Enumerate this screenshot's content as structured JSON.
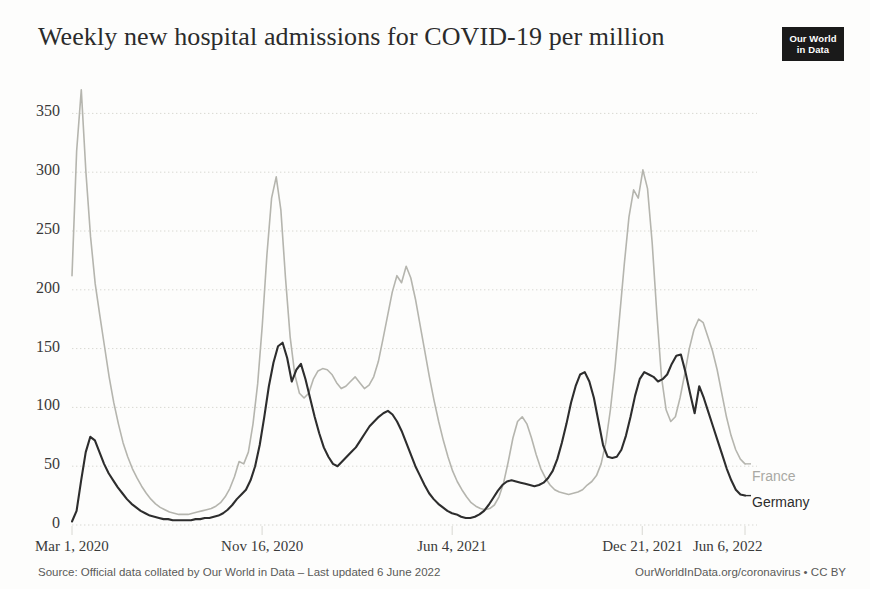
{
  "header": {
    "title": "Weekly new hospital admissions for COVID-19 per million",
    "logo_line1": "Our World",
    "logo_line2": "in Data"
  },
  "footer": {
    "source": "Source: Official data collated by Our World in Data – Last updated 6 June 2022",
    "credit": "OurWorldInData.org/coronavirus • CC BY"
  },
  "legend": {
    "france_label": "France",
    "germany_label": "Germany"
  },
  "colors": {
    "france": "#b5b5ae",
    "germany": "#2d2d2d",
    "grid": "#d8d8d2",
    "text": "#3a3a3a",
    "background": "#fdfdfc",
    "logo_background": "#1a1a1a"
  },
  "chart_data": {
    "type": "line",
    "title": "Weekly new hospital admissions for COVID-19 per million",
    "xlabel": "",
    "ylabel": "",
    "ylim": [
      0,
      375
    ],
    "yticks": [
      0,
      50,
      100,
      150,
      200,
      250,
      300,
      350
    ],
    "ytick_labels": [
      "0",
      "50",
      "100",
      "150",
      "200",
      "250",
      "300",
      "350"
    ],
    "xticks": [
      0,
      37,
      74,
      111,
      131
    ],
    "xtick_labels": [
      "Mar 1, 2020",
      "Nov 16, 2020",
      "Jun 4, 2021",
      "Dec 21, 2021",
      "Jun 6, 2022"
    ],
    "xlim": [
      0,
      131
    ],
    "grid": true,
    "grid_style": "dotted-horizontal",
    "legend_position": "right-inline",
    "x_unit": "week index from Mar 1, 2020",
    "series": [
      {
        "name": "France",
        "color": "#b5b5ae",
        "values": [
          212,
          318,
          370,
          300,
          245,
          205,
          178,
          152,
          126,
          104,
          86,
          70,
          58,
          48,
          40,
          33,
          27,
          22,
          18,
          15,
          13,
          11,
          10,
          9,
          9,
          9,
          10,
          11,
          12,
          13,
          14,
          16,
          19,
          24,
          31,
          41,
          54,
          52,
          62,
          86,
          120,
          170,
          230,
          278,
          296,
          268,
          210,
          160,
          128,
          112,
          108,
          112,
          124,
          131,
          133,
          132,
          128,
          121,
          116,
          118,
          122,
          126,
          121,
          116,
          119,
          126,
          139,
          158,
          178,
          198,
          212,
          206,
          220,
          210,
          192,
          170,
          148,
          126,
          106,
          88,
          72,
          58,
          46,
          37,
          30,
          24,
          19,
          16,
          14,
          13,
          14,
          17,
          24,
          36,
          54,
          74,
          88,
          92,
          86,
          74,
          60,
          48,
          40,
          34,
          30,
          28,
          27,
          26,
          27,
          28,
          30,
          34,
          37,
          42,
          52,
          70,
          98,
          134,
          178,
          222,
          262,
          285,
          278,
          302,
          286,
          240,
          180,
          126,
          98,
          88,
          92,
          108,
          128,
          150,
          166,
          175,
          172,
          160,
          148,
          132,
          112,
          92,
          76,
          64,
          56,
          52
        ]
      },
      {
        "name": "Germany",
        "color": "#2d2d2d",
        "values": [
          3,
          12,
          38,
          62,
          75,
          72,
          62,
          52,
          44,
          38,
          32,
          27,
          22,
          18,
          15,
          12,
          10,
          8,
          7,
          6,
          5,
          5,
          4,
          4,
          4,
          4,
          4,
          5,
          5,
          6,
          6,
          7,
          8,
          10,
          13,
          17,
          22,
          26,
          30,
          38,
          50,
          68,
          92,
          118,
          138,
          152,
          155,
          142,
          122,
          132,
          137,
          124,
          108,
          92,
          78,
          66,
          58,
          52,
          50,
          54,
          58,
          62,
          66,
          72,
          78,
          84,
          88,
          92,
          95,
          97,
          94,
          88,
          80,
          70,
          60,
          50,
          42,
          34,
          27,
          22,
          18,
          15,
          12,
          10,
          9,
          7,
          6,
          6,
          7,
          9,
          12,
          17,
          23,
          29,
          34,
          37,
          38,
          37,
          36,
          35,
          34,
          33,
          34,
          36,
          40,
          46,
          56,
          70,
          86,
          104,
          118,
          128,
          130,
          122,
          108,
          88,
          68,
          58,
          57,
          58,
          64,
          76,
          92,
          110,
          124,
          130,
          128,
          126,
          122,
          124,
          128,
          137,
          144,
          145,
          130,
          112,
          95,
          118,
          108,
          96,
          84,
          72,
          60,
          48,
          38,
          30,
          26,
          25
        ]
      }
    ]
  }
}
